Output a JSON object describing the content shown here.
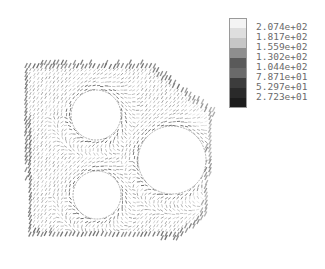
{
  "chart_data": {
    "type": "heatmap",
    "subtype": "vector-field",
    "title": "",
    "xlabel": "",
    "ylabel": "",
    "grid": false,
    "legend_position": "top-right",
    "domain_outline": [
      [
        22,
        62
      ],
      [
        150,
        62
      ],
      [
        215,
        110
      ],
      [
        207,
        215
      ],
      [
        180,
        238
      ],
      [
        28,
        236
      ]
    ],
    "holes": [
      {
        "cx": 96,
        "cy": 115,
        "r": 25
      },
      {
        "cx": 172,
        "cy": 160,
        "r": 34
      },
      {
        "cx": 97,
        "cy": 195,
        "r": 24
      }
    ],
    "colorbar": {
      "levels": [
        {
          "label": "2.074e+02",
          "value": 207.4,
          "color": "#f4f4f4"
        },
        {
          "label": "1.817e+02",
          "value": 181.7,
          "color": "#dedede"
        },
        {
          "label": "1.559e+02",
          "value": 155.9,
          "color": "#c6c6c6"
        },
        {
          "label": "1.302e+02",
          "value": 130.2,
          "color": "#8e8e8e"
        },
        {
          "label": "1.044e+02",
          "value": 104.4,
          "color": "#5a5a5a"
        },
        {
          "label": "7.871e+01",
          "value": 78.71,
          "color": "#6a6a6a"
        },
        {
          "label": "5.297e+01",
          "value": 52.97,
          "color": "#3c3c3c"
        },
        {
          "label": "2.723e+01",
          "value": 27.23,
          "color": "#2a2a2a"
        },
        {
          "label": "",
          "value": null,
          "color": "#1c1c1c"
        }
      ]
    }
  }
}
